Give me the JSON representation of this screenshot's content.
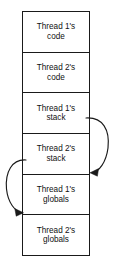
{
  "diagram": {
    "type": "memory-segment-diagram",
    "stroke_color": "#1a1a1a",
    "background_color": "#ffffff",
    "segments": [
      {
        "name": "thread-1-code",
        "line1": "Thread 1's",
        "line2": "code"
      },
      {
        "name": "thread-2-code",
        "line1": "Thread 2's",
        "line2": "code"
      },
      {
        "name": "thread-1-stack",
        "line1": "Thread 1's",
        "line2": "stack"
      },
      {
        "name": "thread-2-stack",
        "line1": "Thread 2's",
        "line2": "stack"
      },
      {
        "name": "thread-1-globals",
        "line1": "Thread 1's",
        "line2": "globals"
      },
      {
        "name": "thread-2-globals",
        "line1": "Thread 2's",
        "line2": "globals"
      }
    ],
    "arrows": [
      {
        "name": "thread-1-stack-to-thread-1-globals",
        "side": "right",
        "from_label": "Thread 1's stack",
        "to_label": "Thread 1's globals"
      },
      {
        "name": "thread-2-stack-to-thread-2-globals",
        "side": "left",
        "from_label": "Thread 2's stack",
        "to_label": "Thread 2's globals"
      }
    ]
  }
}
